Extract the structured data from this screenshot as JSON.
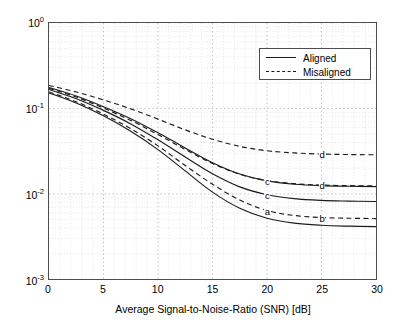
{
  "chart_data": {
    "type": "line",
    "title": "",
    "xlabel": "Average Signal-to-Noise-Ratio (SNR) [dB]",
    "ylabel": "Average Bit Error Rate (BER)",
    "xlim": [
      0,
      30
    ],
    "ylim": [
      0.001,
      1
    ],
    "yscale": "log",
    "xscale": "linear",
    "grid": true,
    "grid_minor": true,
    "xticks": [
      0,
      5,
      10,
      15,
      20,
      25,
      30
    ],
    "xtick_labels": [
      "0",
      "5",
      "10",
      "15",
      "20",
      "25",
      "30"
    ],
    "yticks": [
      0.001,
      0.01,
      0.1,
      1
    ],
    "ytick_labels": [
      "10-3",
      "10-2",
      "10-1",
      "100"
    ],
    "ytick_mantissa": [
      "10",
      "10",
      "10",
      "10"
    ],
    "ytick_exponent": [
      "-3",
      "-2",
      "-1",
      "0"
    ],
    "legend": {
      "position": "upper right",
      "entries": [
        {
          "label": "Aligned",
          "style": "solid"
        },
        {
          "label": "Misaligned",
          "style": "dashed"
        }
      ]
    },
    "x": [
      0,
      2.5,
      5,
      7.5,
      10,
      12.5,
      15,
      17.5,
      20,
      22.5,
      25,
      27.5,
      30
    ],
    "series": [
      {
        "name": "a-aligned",
        "tag": "a",
        "style": "solid",
        "values": [
          0.152,
          0.116,
          0.082,
          0.054,
          0.033,
          0.0186,
          0.0105,
          0.0068,
          0.0052,
          0.00455,
          0.0043,
          0.0042,
          0.00415
        ]
      },
      {
        "name": "b-misaligned",
        "tag": "b",
        "style": "dashed",
        "values": [
          0.156,
          0.12,
          0.086,
          0.058,
          0.0365,
          0.0215,
          0.013,
          0.0085,
          0.0064,
          0.0056,
          0.0053,
          0.0052,
          0.00515
        ]
      },
      {
        "name": "c-aligned",
        "tag": "c",
        "style": "solid",
        "values": [
          0.167,
          0.13,
          0.095,
          0.066,
          0.043,
          0.027,
          0.0172,
          0.0121,
          0.0098,
          0.0088,
          0.0084,
          0.00825,
          0.00815
        ]
      },
      {
        "name": "c-aligned-upper",
        "tag": "c",
        "style": "solid",
        "values": [
          0.176,
          0.14,
          0.105,
          0.076,
          0.052,
          0.0345,
          0.0232,
          0.0171,
          0.0142,
          0.013,
          0.0125,
          0.0123,
          0.0122
        ]
      },
      {
        "name": "d-misaligned",
        "tag": "d",
        "style": "dashed",
        "values": [
          0.172,
          0.136,
          0.101,
          0.0725,
          0.0495,
          0.0332,
          0.0227,
          0.017,
          0.0143,
          0.0132,
          0.0127,
          0.0125,
          0.0124
        ]
      },
      {
        "name": "d-misaligned-upper",
        "tag": "d",
        "style": "dashed",
        "values": [
          0.186,
          0.156,
          0.126,
          0.099,
          0.075,
          0.0562,
          0.0437,
          0.036,
          0.032,
          0.0302,
          0.0293,
          0.0289,
          0.0287
        ]
      }
    ],
    "annotations": [
      {
        "text": "a",
        "x": 20,
        "y": 0.0064
      },
      {
        "text": "b",
        "x": 25,
        "y": 0.0053
      },
      {
        "text": "c",
        "x": 20,
        "y": 0.0142
      },
      {
        "text": "c",
        "x": 20,
        "y": 0.0098
      },
      {
        "text": "d",
        "x": 25,
        "y": 0.0127
      },
      {
        "text": "d",
        "x": 25,
        "y": 0.0293
      }
    ],
    "colors": {
      "curve": "#1a1a1a",
      "axis": "#4d4d4d",
      "grid_major": "#b5b5b5",
      "grid_minor": "#d9d9d9",
      "background": "#ffffff"
    }
  }
}
